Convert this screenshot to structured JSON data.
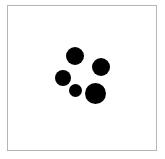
{
  "canvas": {
    "width": 165,
    "height": 159,
    "background": "#ffffff"
  },
  "frame": {
    "x": 7,
    "y": 5,
    "width": 150,
    "height": 146,
    "border_color": "#b5b5b5"
  },
  "dots": [
    {
      "name": "dot-top",
      "cx": 75,
      "cy": 56,
      "r": 9,
      "color": "#000000"
    },
    {
      "name": "dot-right",
      "cx": 101,
      "cy": 67,
      "r": 9,
      "color": "#000000"
    },
    {
      "name": "dot-left",
      "cx": 63,
      "cy": 78,
      "r": 8,
      "color": "#000000"
    },
    {
      "name": "dot-small",
      "cx": 75,
      "cy": 90,
      "r": 6.5,
      "color": "#000000"
    },
    {
      "name": "dot-large",
      "cx": 95,
      "cy": 93,
      "r": 10.5,
      "color": "#000000"
    }
  ],
  "dot_count": 5
}
